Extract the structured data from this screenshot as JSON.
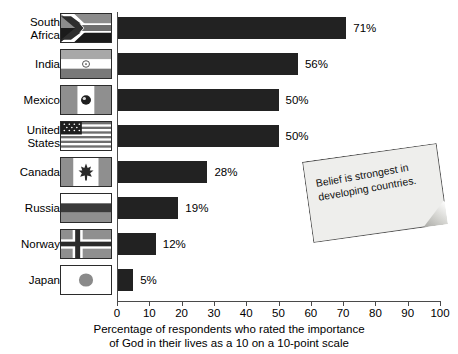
{
  "chart_data": {
    "type": "bar",
    "orientation": "horizontal",
    "title": "",
    "categories": [
      "South Africa",
      "India",
      "Mexico",
      "United States",
      "Canada",
      "Russia",
      "Norway",
      "Japan"
    ],
    "values": [
      71,
      56,
      50,
      50,
      28,
      19,
      12,
      5
    ],
    "value_labels": [
      "71%",
      "56%",
      "50%",
      "50%",
      "28%",
      "19%",
      "12%",
      "5%"
    ],
    "xlabel": "Percentage of respondents who rated the importance of God in their lives as a 10 on a 10-point scale",
    "ylabel": "",
    "xlim": [
      0,
      100
    ],
    "xticks": [
      0,
      10,
      20,
      30,
      40,
      50,
      60,
      70,
      80,
      90,
      100
    ],
    "xtick_labels": [
      "0",
      "10",
      "20",
      "30",
      "40",
      "50",
      "60",
      "70",
      "80",
      "90",
      "100"
    ],
    "grid": false,
    "legend": false,
    "bar_color": "#222222",
    "annotations": [
      "Belief is strongest in developing countries."
    ]
  },
  "rows": [
    {
      "label": "South Africa",
      "label_line1": "South",
      "label_line2": "Africa",
      "value": 71,
      "value_label": "71%",
      "flag": "flag-south-africa"
    },
    {
      "label": "India",
      "label_line1": "India",
      "label_line2": "",
      "value": 56,
      "value_label": "56%",
      "flag": "flag-india"
    },
    {
      "label": "Mexico",
      "label_line1": "Mexico",
      "label_line2": "",
      "value": 50,
      "value_label": "50%",
      "flag": "flag-mexico"
    },
    {
      "label": "United States",
      "label_line1": "United",
      "label_line2": "States",
      "value": 50,
      "value_label": "50%",
      "flag": "flag-united-states"
    },
    {
      "label": "Canada",
      "label_line1": "Canada",
      "label_line2": "",
      "value": 28,
      "value_label": "28%",
      "flag": "flag-canada"
    },
    {
      "label": "Russia",
      "label_line1": "Russia",
      "label_line2": "",
      "value": 19,
      "value_label": "19%",
      "flag": "flag-russia"
    },
    {
      "label": "Norway",
      "label_line1": "Norway",
      "label_line2": "",
      "value": 12,
      "value_label": "12%",
      "flag": "flag-norway"
    },
    {
      "label": "Japan",
      "label_line1": "Japan",
      "label_line2": "",
      "value": 5,
      "value_label": "5%",
      "flag": "flag-japan"
    }
  ],
  "axis": {
    "caption_line1": "Percentage of respondents who rated the importance",
    "caption_line2": "of God in their lives as a 10 on a 10-point scale",
    "ticks": [
      "0",
      "10",
      "20",
      "30",
      "40",
      "50",
      "60",
      "70",
      "80",
      "90",
      "100"
    ]
  },
  "note": {
    "text": "Belief is strongest in developing countries."
  },
  "colors": {
    "bar": "#222222",
    "axis": "#4a4a4a",
    "note_paper": "#eeeeec",
    "text": "#000000"
  }
}
